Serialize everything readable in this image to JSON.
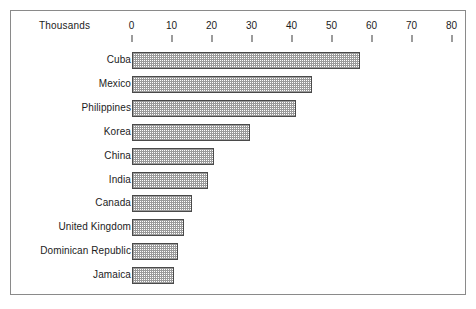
{
  "chart_data": {
    "type": "bar",
    "orientation": "horizontal",
    "title": "",
    "xlabel": "Thousands",
    "ylabel": "",
    "xlim": [
      0,
      80
    ],
    "grid": false,
    "legend": null,
    "axis_caption": "Thousands",
    "tick_labels": [
      "0",
      "10",
      "20",
      "30",
      "40",
      "50",
      "60",
      "70",
      "80"
    ],
    "tick_values": [
      0,
      10,
      20,
      30,
      40,
      50,
      60,
      70,
      80
    ],
    "categories": [
      "Cuba",
      "Mexico",
      "Philippines",
      "Korea",
      "China",
      "India",
      "Canada",
      "United Kingdom",
      "Dominican Republic",
      "Jamaica"
    ],
    "values": [
      57,
      45,
      41,
      29.5,
      20.5,
      19,
      15,
      13,
      11.5,
      10.5
    ],
    "colors": {
      "bar_fill": "#9a9a9a",
      "bar_border": "#4a4a4a",
      "frame_border": "#8a8a8a",
      "text": "#1c1c1c",
      "background": "#ffffff"
    }
  }
}
